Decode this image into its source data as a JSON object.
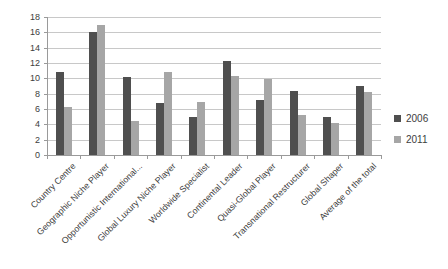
{
  "chart_data": {
    "type": "bar",
    "title": "",
    "xlabel": "",
    "ylabel": "",
    "categories": [
      "Country Centre",
      "Geographic Niche Player",
      "Opportunistic International...",
      "Global Luxury Niche Player",
      "Worldwide Specialist",
      "Continental Leader",
      "Quasi-Global Player",
      "Transnational Restructurer",
      "Global Shaper",
      "Average of the total"
    ],
    "series": [
      {
        "name": "2006",
        "color": "#4f4f4f",
        "values": [
          10.8,
          16.1,
          10.2,
          6.8,
          5.0,
          12.2,
          7.2,
          8.4,
          4.9,
          9.0
        ]
      },
      {
        "name": "2011",
        "color": "#a6a6a6",
        "values": [
          6.2,
          17.0,
          4.4,
          10.8,
          6.9,
          10.3,
          9.9,
          5.2,
          4.2,
          8.2
        ]
      }
    ],
    "ylim": [
      0,
      18
    ],
    "yticks": [
      0,
      2,
      4,
      6,
      8,
      10,
      12,
      14,
      16,
      18
    ],
    "grid": "horizontal",
    "legend_position": "right"
  },
  "style": {
    "background": "#ffffff",
    "gridline_color": "#c8c8c8",
    "axis_color": "#9a9a9a",
    "text_color": "#3d3d3d"
  }
}
